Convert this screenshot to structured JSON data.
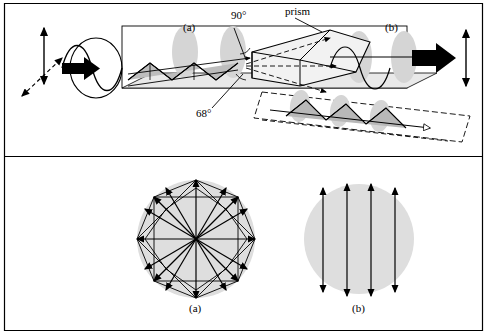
{
  "figure": {
    "top_panel": {
      "labels": [
        {
          "id": "label-a-top",
          "text": "(a)",
          "x": 183,
          "y": 28
        },
        {
          "id": "label-90deg",
          "text": "90°",
          "x": 231,
          "y": 16
        },
        {
          "id": "label-prism",
          "text": "prism",
          "x": 285,
          "y": 13
        },
        {
          "id": "label-b-top",
          "text": "(b)",
          "x": 385,
          "y": 28
        },
        {
          "id": "label-68deg",
          "text": "68°",
          "x": 196,
          "y": 113
        }
      ]
    },
    "bottom_panel": {
      "labels": [
        {
          "id": "label-a-bottom",
          "text": "(a)",
          "x": 196,
          "y": 309
        },
        {
          "id": "label-b-bottom",
          "text": "(b)",
          "x": 359,
          "y": 309
        }
      ]
    },
    "colors": {
      "line": "#000000",
      "beam_fill": "#d7d7d7",
      "disc_fill": "#dcdcdc",
      "ellipse_fill": "#c9c9c9",
      "prism_fill": "#efefef",
      "frame": "#000000",
      "shadow": "#9a9a9a"
    },
    "frame": {
      "outer_top_rule_y": 3,
      "outer_bottom_rule_y": 330
    }
  }
}
